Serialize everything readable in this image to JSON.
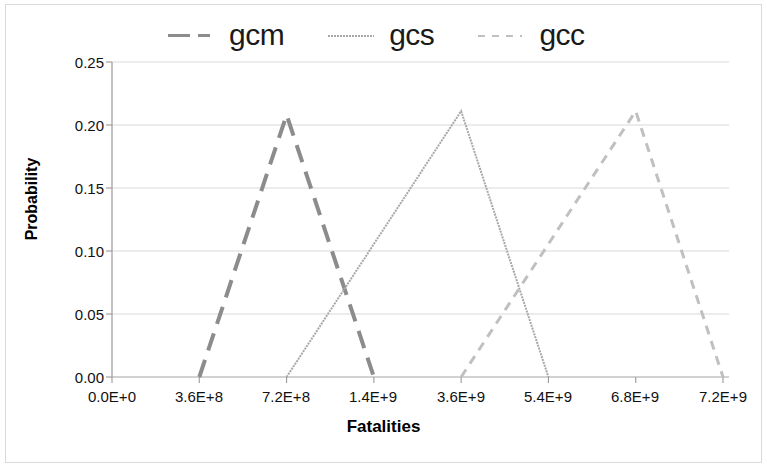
{
  "chart_data": {
    "type": "line",
    "title": "",
    "xlabel": "Fatalities",
    "ylabel": "Probability",
    "grid": true,
    "legend_position": "top",
    "ylim": [
      0.0,
      0.25
    ],
    "yticks": [
      "0.00",
      "0.05",
      "0.10",
      "0.15",
      "0.20",
      "0.25"
    ],
    "ytick_values": [
      0.0,
      0.05,
      0.1,
      0.15,
      0.2,
      0.25
    ],
    "xticks": [
      "0.0E+0",
      "3.6E+8",
      "7.2E+8",
      "1.4E+9",
      "3.6E+9",
      "5.4E+9",
      "6.8E+9",
      "7.2E+9"
    ],
    "xtick_values": [
      0,
      360000000,
      720000000,
      1400000000,
      3600000000,
      5400000000,
      6800000000,
      7200000000
    ],
    "series": [
      {
        "name": "gcm",
        "color": "#8c8c8c",
        "dash": "18,10",
        "width": 4,
        "x": [
          "3.6E+8",
          "7.2E+8",
          "1.4E+9"
        ],
        "y": [
          0.0,
          0.208,
          0.0
        ],
        "peak_x": "7.2E+8",
        "peak_y": 0.208
      },
      {
        "name": "gcs",
        "color": "#a8a8a8",
        "dash": "2,1",
        "width": 2,
        "x": [
          "7.2E+8",
          "3.6E+9",
          "5.4E+9"
        ],
        "y": [
          0.0,
          0.211,
          0.0
        ],
        "peak_x": "3.6E+9",
        "peak_y": 0.211
      },
      {
        "name": "gcc",
        "color": "#c0c0c0",
        "dash": "9,7",
        "width": 3,
        "x": [
          "3.6E+9",
          "6.8E+9",
          "7.2E+9"
        ],
        "y": [
          0.0,
          0.211,
          0.0
        ],
        "peak_x": "6.8E+9",
        "peak_y": 0.211
      }
    ]
  },
  "legend": {
    "items": [
      {
        "label": "gcm"
      },
      {
        "label": "gcs"
      },
      {
        "label": "gcc"
      }
    ]
  },
  "axes": {
    "ylabel": "Probability",
    "xlabel": "Fatalities",
    "yticks": [
      "0.25",
      "0.20",
      "0.15",
      "0.10",
      "0.05",
      "0.00"
    ],
    "xticks": [
      "0.0E+0",
      "3.6E+8",
      "7.2E+8",
      "1.4E+9",
      "3.6E+9",
      "5.4E+9",
      "6.8E+9",
      "7.2E+9"
    ]
  }
}
